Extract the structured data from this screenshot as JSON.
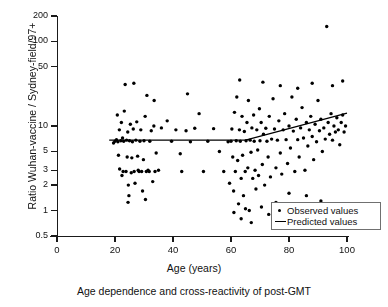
{
  "chart_data": {
    "type": "scatter",
    "title": "",
    "caption": "Age dependence and cross-reactivity of post-GMT",
    "xlabel": "Age (years)",
    "ylabel": "Ratio Wuhan-vaccine / Sydney-field/97+",
    "xlim": [
      0,
      100
    ],
    "ylim": [
      0.5,
      200
    ],
    "yscale": "log",
    "grid": false,
    "xticks": [
      0,
      20,
      40,
      60,
      80,
      100
    ],
    "xtick_labels": [
      "0",
      "20",
      "40",
      "60",
      "80",
      "100"
    ],
    "yticks": [
      0.5,
      1,
      2,
      3,
      5,
      10,
      50,
      100,
      200
    ],
    "ytick_labels": [
      "0.5",
      "1",
      "2",
      "3",
      "5",
      "10",
      "50",
      "100",
      "200"
    ],
    "legend_position": "lower-right",
    "series": [
      {
        "name": "Observed values",
        "type": "scatter",
        "marker": "dot",
        "color": "#000000",
        "points": [
          [
            19.5,
            6.3
          ],
          [
            20.0,
            6.6
          ],
          [
            20.5,
            6.9
          ],
          [
            21.0,
            6.5
          ],
          [
            21.2,
            4.5
          ],
          [
            21.5,
            9.0
          ],
          [
            21.6,
            3.1
          ],
          [
            22.0,
            6.7
          ],
          [
            22.2,
            11.0
          ],
          [
            22.4,
            2.6
          ],
          [
            22.6,
            7.2
          ],
          [
            22.8,
            2.9
          ],
          [
            23.0,
            6.6
          ],
          [
            23.2,
            15.0
          ],
          [
            23.5,
            31.0
          ],
          [
            23.8,
            2.9
          ],
          [
            24.0,
            6.8
          ],
          [
            24.2,
            4.3
          ],
          [
            24.4,
            8.5
          ],
          [
            24.6,
            2.0
          ],
          [
            24.8,
            1.5
          ],
          [
            25.0,
            6.7
          ],
          [
            25.3,
            10.5
          ],
          [
            25.6,
            2.8
          ],
          [
            25.8,
            4.2
          ],
          [
            26.0,
            6.5
          ],
          [
            26.3,
            9.2
          ],
          [
            26.6,
            2.9
          ],
          [
            26.9,
            2.1
          ],
          [
            27.2,
            6.8
          ],
          [
            27.5,
            11.2
          ],
          [
            27.8,
            4.4
          ],
          [
            28.0,
            3.0
          ],
          [
            28.3,
            2.9
          ],
          [
            28.6,
            6.6
          ],
          [
            28.9,
            9.0
          ],
          [
            29.2,
            2.9
          ],
          [
            29.5,
            1.7
          ],
          [
            29.8,
            4.0
          ],
          [
            30.0,
            6.7
          ],
          [
            30.4,
            13.0
          ],
          [
            30.8,
            2.9
          ],
          [
            31.0,
            23.0
          ],
          [
            31.4,
            3.0
          ],
          [
            31.8,
            2.9
          ],
          [
            32.0,
            6.6
          ],
          [
            32.5,
            8.8
          ],
          [
            33.0,
            2.2
          ],
          [
            33.4,
            10.0
          ],
          [
            33.8,
            2.9
          ],
          [
            34.2,
            4.8
          ],
          [
            35.0,
            3.0
          ],
          [
            36.0,
            9.5
          ],
          [
            38.0,
            11.5
          ],
          [
            39.5,
            6.6
          ],
          [
            41.0,
            9.0
          ],
          [
            42.5,
            4.7
          ],
          [
            43.0,
            2.9
          ],
          [
            44.5,
            8.8
          ],
          [
            46.0,
            6.5
          ],
          [
            47.5,
            9.4
          ],
          [
            49.0,
            14.0
          ],
          [
            50.5,
            2.9
          ],
          [
            52.0,
            6.6
          ],
          [
            54.0,
            9.3
          ],
          [
            56.0,
            5.0
          ],
          [
            57.5,
            2.9
          ],
          [
            59.0,
            6.5
          ],
          [
            59.5,
            2.1
          ],
          [
            60.0,
            6.6
          ],
          [
            60.3,
            9.2
          ],
          [
            60.6,
            4.3
          ],
          [
            60.9,
            1.7
          ],
          [
            61.2,
            14.5
          ],
          [
            61.5,
            2.9
          ],
          [
            61.8,
            6.7
          ],
          [
            62.0,
            22.0
          ],
          [
            62.3,
            3.9
          ],
          [
            62.6,
            1.2
          ],
          [
            62.9,
            9.0
          ],
          [
            63.2,
            6.6
          ],
          [
            63.5,
            2.4
          ],
          [
            63.8,
            13.0
          ],
          [
            64.0,
            4.5
          ],
          [
            64.3,
            1.5
          ],
          [
            64.6,
            8.6
          ],
          [
            64.9,
            2.9
          ],
          [
            65.2,
            6.7
          ],
          [
            65.5,
            11.0
          ],
          [
            65.8,
            3.2
          ],
          [
            66.0,
            20.0
          ],
          [
            66.3,
            1.0
          ],
          [
            66.6,
            6.8
          ],
          [
            66.9,
            4.9
          ],
          [
            67.2,
            9.5
          ],
          [
            67.5,
            2.4
          ],
          [
            67.8,
            13.5
          ],
          [
            68.0,
            6.6
          ],
          [
            68.3,
            3.0
          ],
          [
            68.6,
            1.8
          ],
          [
            68.9,
            9.0
          ],
          [
            69.2,
            5.2
          ],
          [
            69.5,
            2.6
          ],
          [
            69.8,
            16.0
          ],
          [
            70.0,
            6.7
          ],
          [
            70.4,
            11.0
          ],
          [
            70.8,
            3.5
          ],
          [
            71.2,
            8.0
          ],
          [
            71.6,
            2.0
          ],
          [
            72.0,
            9.4
          ],
          [
            72.4,
            6.6
          ],
          [
            72.8,
            4.3
          ],
          [
            73.2,
            13.0
          ],
          [
            73.6,
            2.5
          ],
          [
            74.0,
            7.0
          ],
          [
            74.5,
            21.0
          ],
          [
            75.0,
            9.2
          ],
          [
            75.5,
            3.2
          ],
          [
            76.0,
            6.8
          ],
          [
            76.5,
            11.5
          ],
          [
            77.0,
            4.8
          ],
          [
            77.5,
            2.7
          ],
          [
            78.0,
            9.0
          ],
          [
            78.5,
            14.0
          ],
          [
            79.0,
            6.9
          ],
          [
            79.5,
            3.6
          ],
          [
            80.0,
            10.0
          ],
          [
            80.5,
            5.5
          ],
          [
            81.0,
            22.0
          ],
          [
            81.5,
            8.7
          ],
          [
            82.0,
            2.9
          ],
          [
            82.5,
            12.0
          ],
          [
            83.0,
            6.9
          ],
          [
            83.5,
            4.3
          ],
          [
            84.0,
            9.5
          ],
          [
            84.5,
            16.5
          ],
          [
            85.0,
            7.2
          ],
          [
            85.5,
            3.0
          ],
          [
            86.0,
            11.0
          ],
          [
            86.5,
            5.8
          ],
          [
            87.0,
            9.0
          ],
          [
            87.5,
            13.0
          ],
          [
            88.0,
            7.5
          ],
          [
            88.5,
            4.0
          ],
          [
            89.0,
            10.5
          ],
          [
            89.5,
            6.5
          ],
          [
            90.0,
            20.0
          ],
          [
            90.5,
            8.8
          ],
          [
            91.0,
            12.0
          ],
          [
            91.5,
            5.0
          ],
          [
            92.0,
            9.5
          ],
          [
            92.5,
            7.0
          ],
          [
            93.0,
            150.0
          ],
          [
            93.5,
            11.0
          ],
          [
            94.0,
            8.0
          ],
          [
            94.5,
            14.0
          ],
          [
            95.0,
            6.8
          ],
          [
            95.5,
            10.0
          ],
          [
            96.0,
            8.5
          ],
          [
            96.5,
            12.5
          ],
          [
            97.0,
            9.0
          ],
          [
            97.5,
            6.0
          ],
          [
            98.0,
            11.0
          ],
          [
            98.5,
            13.5
          ],
          [
            99.0,
            8.5
          ],
          [
            99.5,
            10.0
          ],
          [
            20.8,
            13.5
          ],
          [
            26.5,
            32.0
          ],
          [
            33.5,
            20.0
          ],
          [
            45.0,
            24.0
          ],
          [
            63.0,
            35.0
          ],
          [
            71.0,
            33.0
          ],
          [
            77.0,
            30.0
          ],
          [
            83.0,
            28.0
          ],
          [
            88.0,
            32.0
          ],
          [
            95.0,
            30.0
          ],
          [
            98.5,
            34.0
          ],
          [
            61.0,
            0.95
          ],
          [
            63.5,
            0.8
          ],
          [
            65.0,
            1.05
          ],
          [
            70.5,
            1.1
          ],
          [
            73.0,
            0.9
          ],
          [
            80.0,
            1.6
          ],
          [
            86.0,
            1.5
          ],
          [
            91.0,
            1.3
          ],
          [
            24.5,
            1.25
          ],
          [
            30.5,
            1.35
          ],
          [
            67.0,
            0.72
          ],
          [
            75.5,
            1.25
          ]
        ]
      },
      {
        "name": "Predicted values",
        "type": "line",
        "color": "#000000",
        "points": [
          [
            18.0,
            6.8
          ],
          [
            65.0,
            6.8
          ],
          [
            100.0,
            14.2
          ]
        ]
      }
    ],
    "legend_entries": [
      {
        "label": "Observed values",
        "key": "dot"
      },
      {
        "label": "Predicted values",
        "key": "line"
      }
    ]
  },
  "axes": {
    "x": {
      "title": "Age (years)",
      "ticks": [
        {
          "value": 0,
          "label": "0"
        },
        {
          "value": 20,
          "label": "20"
        },
        {
          "value": 40,
          "label": "40"
        },
        {
          "value": 60,
          "label": "60"
        },
        {
          "value": 80,
          "label": "80"
        },
        {
          "value": 100,
          "label": "100"
        }
      ]
    },
    "y": {
      "title": "Ratio Wuhan-vaccine / Sydney-field/97+",
      "ticks": [
        {
          "value": 200,
          "label": "200"
        },
        {
          "value": 100,
          "label": "100"
        },
        {
          "value": 50,
          "label": "50"
        },
        {
          "value": 10,
          "label": "10"
        },
        {
          "value": 5,
          "label": "5"
        },
        {
          "value": 3,
          "label": "3"
        },
        {
          "value": 2,
          "label": "2"
        },
        {
          "value": 1,
          "label": "1"
        },
        {
          "value": 0.5,
          "label": "0.5"
        }
      ]
    }
  },
  "caption": "Age dependence and cross-reactivity of post-GMT",
  "colors": {
    "marker": "#000000",
    "line": "#000000",
    "axis": "#1a1a1a",
    "legend_border": "#707070",
    "background": "#ffffff"
  }
}
